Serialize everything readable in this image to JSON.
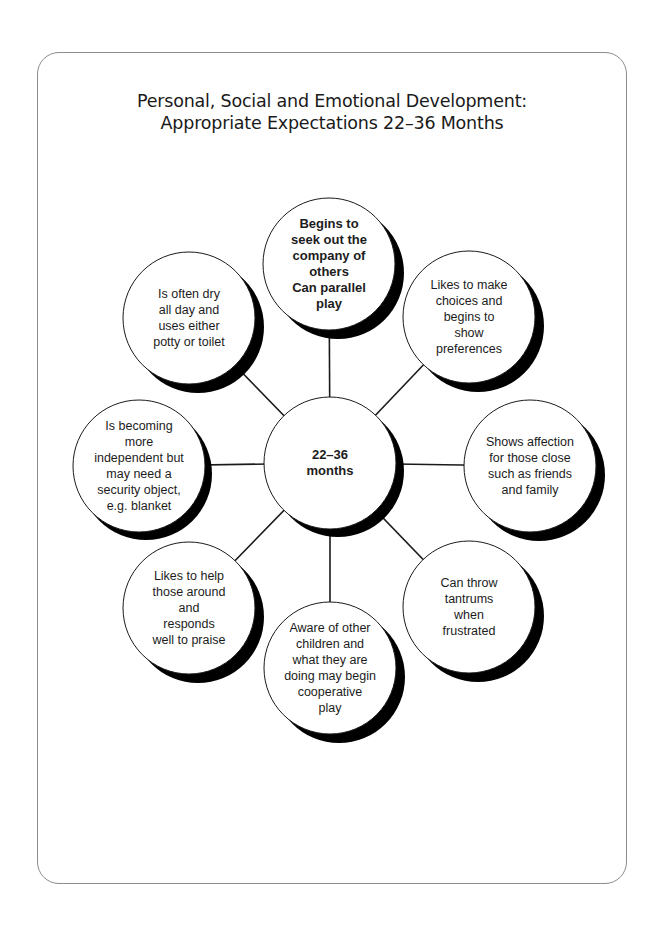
{
  "title": {
    "line1": "Personal, Social and Emotional Development:",
    "line2": "Appropriate Expectations 22–36 Months"
  },
  "hub": {
    "label_line1": "22–36",
    "label_line2": "months"
  },
  "nodes": [
    {
      "id": "top",
      "text": "Begins to seek out the company of others Can parallel play",
      "bold": true
    },
    {
      "id": "upper-right",
      "text": "Likes to make choices and begins to show preferences"
    },
    {
      "id": "right",
      "text": "Shows affection for those close such as friends and family"
    },
    {
      "id": "lower-right",
      "text": "Can throw tantrums when frustrated"
    },
    {
      "id": "bottom",
      "text": "Aware of other children and what they are doing may begin cooperative play"
    },
    {
      "id": "lower-left",
      "text": "Likes to help those around and responds well to praise"
    },
    {
      "id": "left",
      "text": "Is becoming more independent but may need a security object, e.g. blanket"
    },
    {
      "id": "upper-left",
      "text": "Is often dry all day and uses either potty or toilet"
    }
  ],
  "node_lines": {
    "top": [
      "Begins to",
      "seek out the",
      "company of",
      "others",
      "Can parallel",
      "play"
    ],
    "upper_right": [
      "Likes to make",
      "choices and",
      "begins to",
      "show",
      "preferences"
    ],
    "right": [
      "Shows affection",
      "for those close",
      "such as friends",
      "and family"
    ],
    "lower_right": [
      "Can throw",
      "tantrums",
      "when",
      "frustrated"
    ],
    "bottom": [
      "Aware of other",
      "children and",
      "what they are",
      "doing may begin",
      "cooperative",
      "play"
    ],
    "lower_left": [
      "Likes to help",
      "those around",
      "and",
      "responds",
      "well to praise"
    ],
    "left": [
      "Is becoming",
      "more",
      "independent but",
      "may need a",
      "security object,",
      "e.g. blanket"
    ],
    "upper_left": [
      "Is often dry",
      "all day and",
      "uses either",
      "potty or toilet"
    ]
  },
  "colors": {
    "stroke": "#1a1a1a",
    "shadow": "#000000",
    "frame": "#8c8c8c",
    "fill": "#ffffff"
  }
}
